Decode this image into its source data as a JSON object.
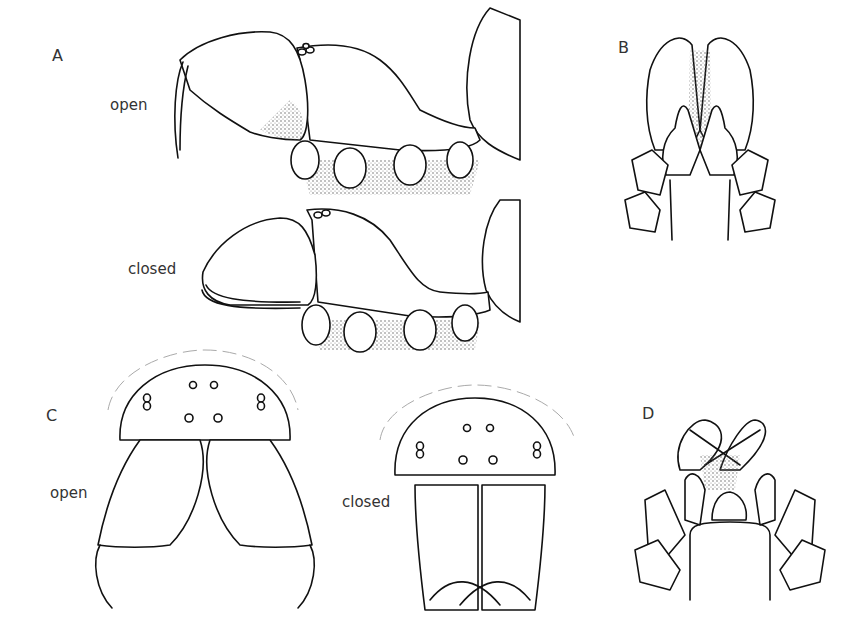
{
  "figure": {
    "panels": [
      {
        "id": "A",
        "label": "A",
        "views": [
          "open",
          "closed"
        ],
        "description": "lateral view of prosoma with chelicerae"
      },
      {
        "id": "B",
        "label": "B",
        "views": [],
        "description": "ventral view of chelicerae and mouthparts"
      },
      {
        "id": "C",
        "label": "C",
        "views": [
          "open",
          "closed"
        ],
        "description": "frontal view of carapace and chelicerae"
      },
      {
        "id": "D",
        "label": "D",
        "views": [],
        "description": "ventral view with fangs crossed"
      }
    ],
    "labels": {
      "A": "A",
      "B": "B",
      "C": "C",
      "D": "D",
      "a_open": "open",
      "a_closed": "closed",
      "c_open": "open",
      "c_closed": "closed"
    }
  }
}
